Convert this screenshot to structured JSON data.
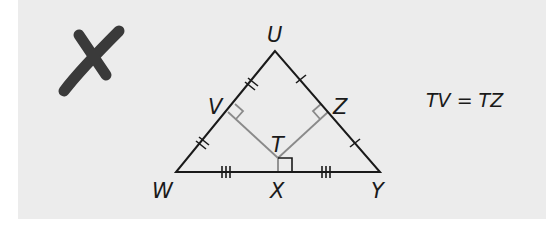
{
  "figure": {
    "mark": {
      "symbol": "X",
      "meaning": "incorrect",
      "color": "#3a3a3a"
    },
    "vertices": {
      "U": "U",
      "V": "V",
      "Z": "Z",
      "T": "T",
      "W": "W",
      "X": "X",
      "Y": "Y"
    },
    "statement": "TV = TZ",
    "colors": {
      "background": "#ececec",
      "triangle_stroke": "#1a1a1a",
      "perpendicular_stroke": "#8a8a8a"
    }
  }
}
